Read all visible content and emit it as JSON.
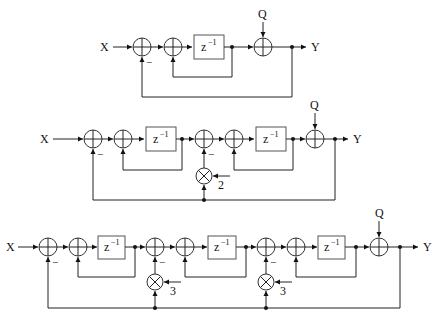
{
  "diagram": {
    "type": "block-diagram",
    "labels": {
      "input": "X",
      "output": "Y",
      "noise": "Q",
      "delay": "z",
      "delay_exp": "−1",
      "minus": "−",
      "gain2": "2",
      "gain3": "3"
    },
    "stages": [
      {
        "name": "first-order",
        "integrators": 1,
        "gains": []
      },
      {
        "name": "second-order",
        "integrators": 2,
        "gains": [
          "2"
        ]
      },
      {
        "name": "third-order",
        "integrators": 3,
        "gains": [
          "3",
          "3"
        ]
      }
    ]
  }
}
